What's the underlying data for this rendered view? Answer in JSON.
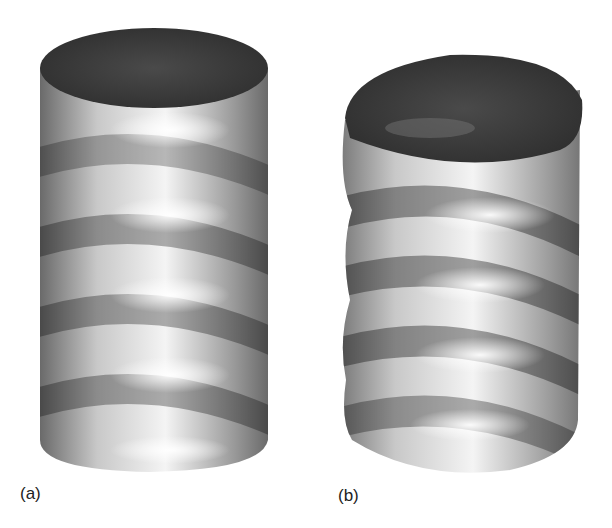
{
  "figure": {
    "panels": [
      {
        "id": "a",
        "label": "(a)",
        "description": "Cylinder with helical buckling waves (regular)"
      },
      {
        "id": "b",
        "label": "(b)",
        "description": "Cylinder with helical buckling waves (deformed, tilted top)"
      }
    ],
    "colors": {
      "background": "#ffffff",
      "top_dark": "#3c3c3c",
      "shell_light": "#f2f2f2",
      "shell_mid": "#a8a8a8",
      "shell_dark": "#5a5a5a"
    }
  }
}
